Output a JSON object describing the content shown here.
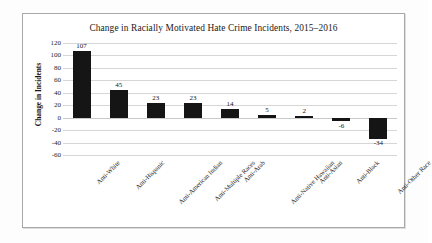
{
  "chart_data": {
    "type": "bar",
    "title": "Change in Racially Motivated Hate Crime Incidents, 2015–2016",
    "xlabel": "",
    "ylabel": "Change in Incidents",
    "categories": [
      "Anti-White",
      "Anti-Hispanic",
      "Anti-American Indian",
      "Anti-Multiple Races",
      "Anti-Arab",
      "Anti-Native Hawaiian",
      "Anti-Asian",
      "Anti-Black",
      "Anti-Other Race"
    ],
    "values": [
      107,
      45,
      23,
      23,
      14,
      5,
      2,
      -6,
      -34
    ],
    "data_labels": [
      "107",
      "45",
      "23",
      "23",
      "14",
      "5",
      "2",
      "-6",
      "-34"
    ],
    "ylim": [
      -60,
      120
    ],
    "ytick_step": 20,
    "ytick_labels": [
      "120",
      "100",
      "80",
      "60",
      "40",
      "20",
      "0",
      "-20",
      "-40",
      "-60"
    ],
    "grid": true,
    "legend": false,
    "bar_color": "#151515",
    "gridline_color": "#d6d6d6",
    "background_color": "#ffffff"
  }
}
